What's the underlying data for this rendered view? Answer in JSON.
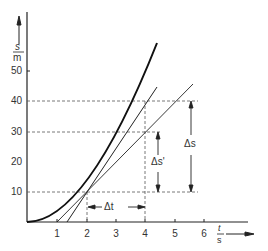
{
  "diagram": {
    "type": "s-t graph with secant and tangent",
    "y_axis": {
      "label_num": "s",
      "label_den": "m",
      "ticks": [
        "10",
        "20",
        "30",
        "40",
        "50"
      ]
    },
    "x_axis": {
      "label_num": "t",
      "label_den": "s",
      "ticks": [
        "1",
        "2",
        "3",
        "4",
        "5",
        "6"
      ]
    },
    "annotations": {
      "delta_t": "Δt",
      "delta_s": "Δs",
      "delta_s_prime": "Δs'"
    },
    "curve": "s = 2.5 t^2 (approx)",
    "secant": {
      "from": [
        2,
        10
      ],
      "to": [
        4,
        40
      ]
    },
    "tangent": {
      "at": [
        2,
        10
      ],
      "slope": 10
    }
  }
}
